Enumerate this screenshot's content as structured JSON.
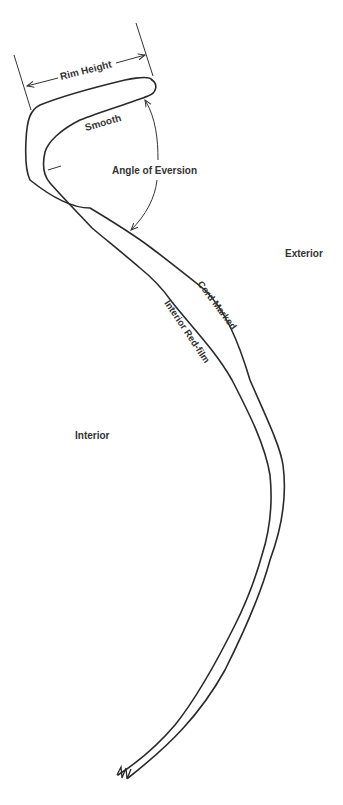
{
  "diagram": {
    "labels": {
      "rim_height": "Rim Height",
      "smooth": "Smooth",
      "angle_of_eversion": "Angle of Eversion",
      "exterior": "Exterior",
      "interior": "Interior",
      "cord_marked": "Cord Marked",
      "interior_red_film": "Interior Red-film"
    },
    "colors": {
      "line": "#2a2a2a",
      "text": "#333333",
      "background": "#ffffff"
    }
  }
}
